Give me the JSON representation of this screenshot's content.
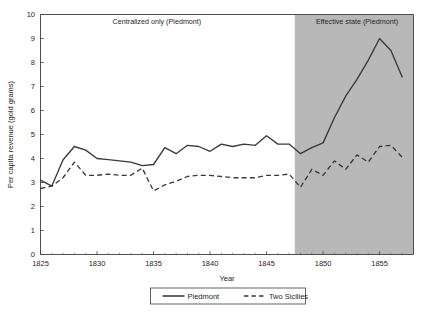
{
  "chart_data": {
    "type": "line",
    "title": "",
    "xlabel": "Year",
    "ylabel": "Per capita revenue (gold grams)",
    "xlim": [
      1825,
      1858
    ],
    "ylim": [
      0,
      10
    ],
    "grid": false,
    "legend_position": "bottom",
    "x_ticks": [
      1825,
      1830,
      1835,
      1840,
      1845,
      1850,
      1855
    ],
    "x_tick_labels": [
      "1825",
      "1830",
      "1835",
      "1840",
      "1845",
      "1850",
      "1855"
    ],
    "y_ticks": [
      0,
      1,
      2,
      3,
      4,
      5,
      6,
      7,
      8,
      9,
      10
    ],
    "y_tick_labels": [
      "0",
      "1",
      "2",
      "3",
      "4",
      "5",
      "6",
      "7",
      "8",
      "9",
      "10"
    ],
    "annotations": [
      {
        "name": "centralized-only-label",
        "text": "Centralized only (Piedmont)",
        "x_center": 1835.3,
        "y": 9.62
      },
      {
        "name": "effective-state-label",
        "text": "Effective state (Piedmont)",
        "x_center": 1853.0,
        "y": 9.62
      }
    ],
    "shaded_regions": [
      {
        "name": "effective-state-shading",
        "x_start": 1847.5,
        "x_end": 1858.0,
        "color": "#b8b8b8"
      }
    ],
    "x": [
      1825,
      1826,
      1827,
      1828,
      1829,
      1830,
      1831,
      1832,
      1833,
      1834,
      1835,
      1836,
      1837,
      1838,
      1839,
      1840,
      1841,
      1842,
      1843,
      1844,
      1845,
      1846,
      1847,
      1848,
      1849,
      1850,
      1851,
      1852,
      1853,
      1854,
      1855,
      1856,
      1857
    ],
    "series": [
      {
        "name": "Piedmont",
        "style": "solid",
        "color": "#3a3a3a",
        "values": [
          3.1,
          2.85,
          3.95,
          4.5,
          4.35,
          4.0,
          3.95,
          3.9,
          3.85,
          3.7,
          3.75,
          4.45,
          4.2,
          4.55,
          4.5,
          4.3,
          4.6,
          4.5,
          4.6,
          4.55,
          4.95,
          4.6,
          4.6,
          4.2,
          4.45,
          4.65,
          5.7,
          6.6,
          7.3,
          8.1,
          9.0,
          8.5,
          7.4
        ]
      },
      {
        "name": "Two Sicilies",
        "style": "dashed",
        "color": "#3a3a3a",
        "values": [
          2.75,
          2.85,
          3.2,
          3.85,
          3.3,
          3.3,
          3.35,
          3.3,
          3.3,
          3.6,
          2.65,
          2.9,
          3.05,
          3.25,
          3.3,
          3.3,
          3.25,
          3.2,
          3.2,
          3.2,
          3.3,
          3.3,
          3.35,
          2.8,
          3.55,
          3.3,
          3.9,
          3.55,
          4.15,
          3.85,
          4.5,
          4.55,
          4.05
        ]
      }
    ],
    "legend": [
      {
        "label": "Piedmont",
        "style": "solid"
      },
      {
        "label": "Two Sicilies",
        "style": "dashed"
      }
    ]
  }
}
